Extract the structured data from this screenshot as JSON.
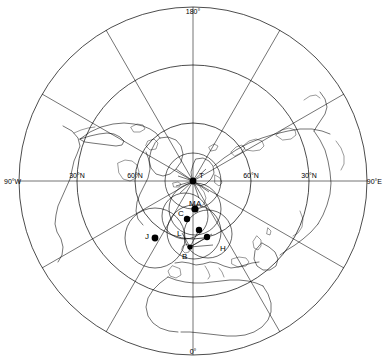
{
  "map": {
    "projection": "polar-azimuthal-north",
    "center": {
      "x": 193,
      "y": 181
    },
    "graticule": {
      "latitude_circles": [
        {
          "label": "0°N",
          "radius": 174,
          "labeled": false
        },
        {
          "label": "30°N",
          "radius": 116,
          "labeled": true
        },
        {
          "label": "60°N",
          "radius": 58,
          "labeled": true
        }
      ],
      "meridian_labels": [
        {
          "text": "180°",
          "x": 193,
          "y": 14,
          "anchor": "middle"
        },
        {
          "text": "0°",
          "x": 193,
          "y": 352,
          "anchor": "middle"
        },
        {
          "text": "90°W",
          "x": 4,
          "y": 184,
          "anchor": "start"
        },
        {
          "text": "90°E",
          "x": 382,
          "y": 184,
          "anchor": "end"
        }
      ],
      "latitude_tick_labels": [
        {
          "text": "30°N",
          "x": 77,
          "y": 184,
          "anchor": "middle"
        },
        {
          "text": "60°N",
          "x": 135,
          "y": 184,
          "anchor": "middle"
        },
        {
          "text": "60°N",
          "x": 251,
          "y": 184,
          "anchor": "middle"
        },
        {
          "text": "30°N",
          "x": 309,
          "y": 184,
          "anchor": "middle"
        }
      ],
      "meridian_spacing_deg": 30,
      "grid_on": true
    },
    "stations": [
      {
        "id": "T",
        "label": "T",
        "dot": {
          "x": 193,
          "y": 181
        },
        "label_pos": {
          "x": 198,
          "y": 178
        },
        "range_radius": 28
      },
      {
        "id": "M",
        "label": "M",
        "dot": {
          "x": 195,
          "y": 209
        },
        "label_pos": {
          "x": 192,
          "y": 205
        },
        "range_radius": 26
      },
      {
        "id": "A",
        "label": "A",
        "dot": {
          "x": 199,
          "y": 207
        },
        "label_pos": {
          "x": 199,
          "y": 204
        },
        "range_radius": 0
      },
      {
        "id": "C",
        "label": "C",
        "dot": {
          "x": 187,
          "y": 219
        },
        "label_pos": {
          "x": 180,
          "y": 214
        },
        "range_radius": 0
      },
      {
        "id": "L",
        "label": "L",
        "dot": {
          "x": 194,
          "y": 232
        },
        "label_pos": {
          "x": 178,
          "y": 233
        },
        "range_radius": 27
      },
      {
        "id": "J",
        "label": "J",
        "dot": {
          "x": 155,
          "y": 238
        },
        "label_pos": {
          "x": 146,
          "y": 237
        },
        "range_radius": 30
      },
      {
        "id": "B",
        "label": "B",
        "dot": {
          "x": 190,
          "y": 247
        },
        "label_pos": {
          "x": 183,
          "y": 257
        },
        "range_radius": 0
      },
      {
        "id": "H",
        "label": "H",
        "dot": {
          "x": 206,
          "y": 238
        },
        "label_pos": {
          "x": 222,
          "y": 249
        },
        "range_radius": 0
      }
    ],
    "visible_continents": [
      "North America",
      "Greenland",
      "Eurasia",
      "Siberia",
      "Europe",
      "Africa",
      "Arabian Peninsula",
      "Alaska",
      "Iceland"
    ]
  }
}
